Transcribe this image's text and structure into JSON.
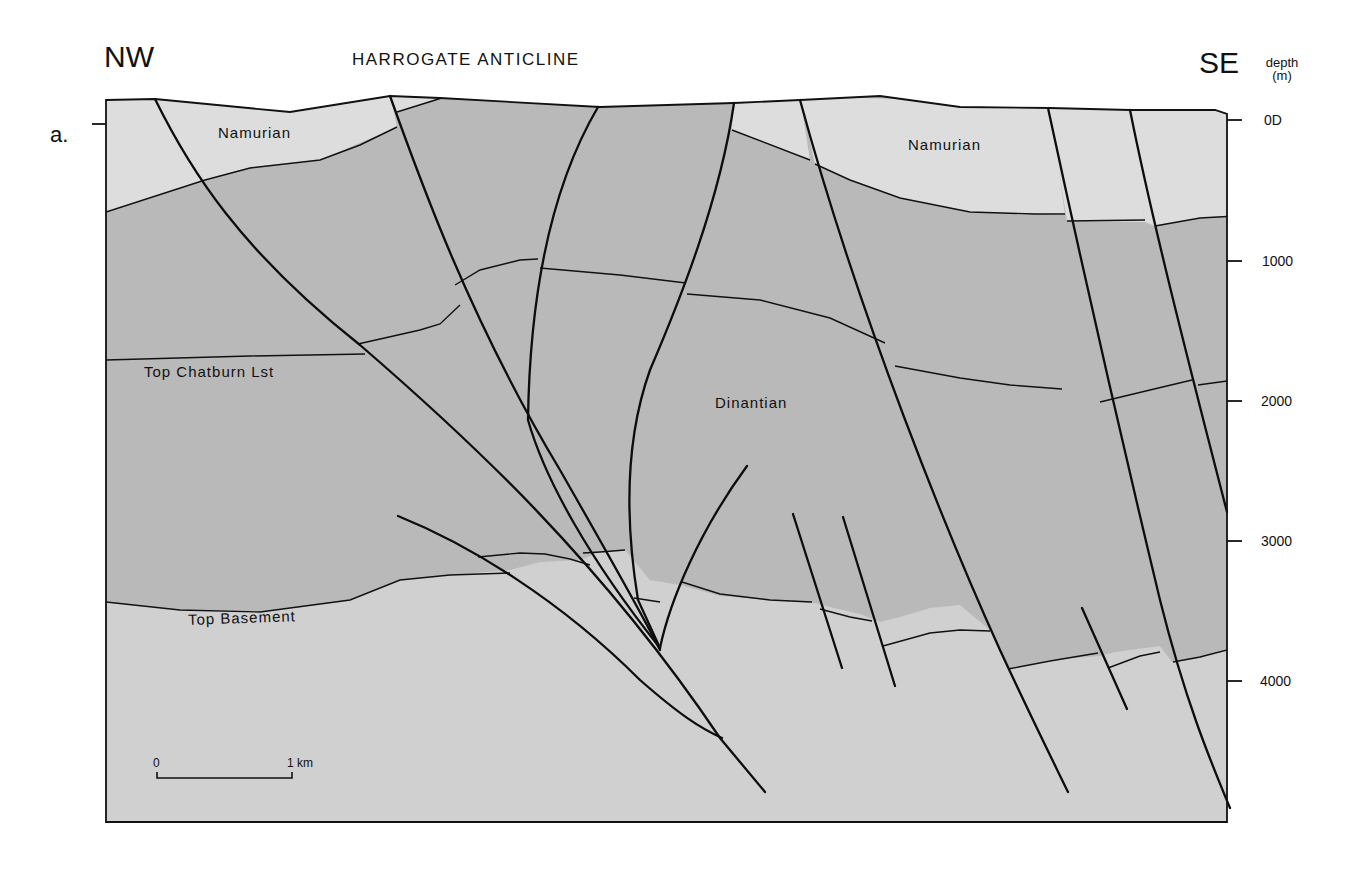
{
  "header": {
    "left_direction": "NW",
    "right_direction": "SE",
    "title": "HARROGATE ANTICLINE",
    "panel_label": "a."
  },
  "depth_axis": {
    "label_line1": "depth",
    "label_line2": "(m)",
    "ticks": [
      "0D",
      "1000",
      "2000",
      "3000",
      "4000"
    ]
  },
  "units": {
    "namurian_left": "Namurian",
    "namurian_right": "Namurian",
    "dinantian": "Dinantian",
    "top_chatburn": "Top Chatburn Lst",
    "top_basement": "Top Basement"
  },
  "scale_bar": {
    "start": "0",
    "end": "1 km"
  },
  "colors": {
    "namurian": "#dcdcdc",
    "dinantian": "#b8b8b8",
    "basement": "#cfcfcf",
    "lines": "#111111"
  }
}
